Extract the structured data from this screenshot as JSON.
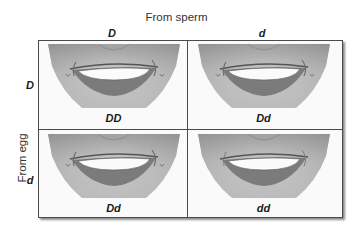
{
  "diagram": {
    "type": "punnett-square",
    "top_title": "From sperm",
    "side_title": "From egg",
    "columns": [
      {
        "allele": "D"
      },
      {
        "allele": "d"
      }
    ],
    "rows": [
      {
        "allele": "D"
      },
      {
        "allele": "d"
      }
    ],
    "cells": [
      {
        "genotype": "DD",
        "image": "smiling-face-dimples"
      },
      {
        "genotype": "Dd",
        "image": "smiling-face-dimples"
      },
      {
        "genotype": "Dd",
        "image": "smiling-face-dimples"
      },
      {
        "genotype": "dd",
        "image": "smiling-face-no-dimples"
      }
    ]
  },
  "colors": {
    "border": "#4a4a4a",
    "background": "#ffffff",
    "cell_background": "#fafafa"
  }
}
